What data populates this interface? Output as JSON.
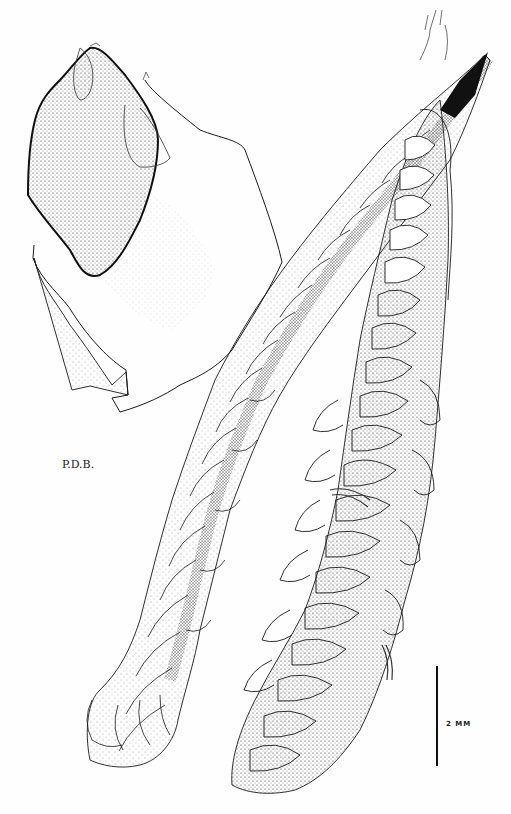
{
  "plate": {
    "subject": "botanical pen-and-ink illustration of leafy shoots with detail of a single leaf",
    "signature": "P.D.B.",
    "scale_bar": {
      "label": "2 MM",
      "length_mm": 2
    }
  },
  "colors": {
    "ink": "#1a1a1a",
    "paper": "#fefefe"
  }
}
